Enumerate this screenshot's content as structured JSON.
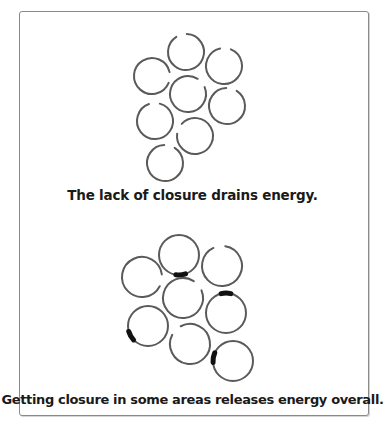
{
  "colors": {
    "ring_stroke": "#5a5a5a",
    "closure_mark": "#111111",
    "frame_border": "#8a8a8a",
    "caption_text": "#1a1a1a"
  },
  "panels": [
    {
      "caption": "The lack of closure drains energy.",
      "ring_radius": 18,
      "rings": [
        {
          "cx": 186,
          "cy": 52,
          "state": "open",
          "gap_center_deg": 255,
          "gap_size_deg": 35
        },
        {
          "cx": 152,
          "cy": 76,
          "state": "open",
          "gap_center_deg": 5,
          "gap_size_deg": 35
        },
        {
          "cx": 224,
          "cy": 66,
          "state": "open",
          "gap_center_deg": 275,
          "gap_size_deg": 35
        },
        {
          "cx": 188,
          "cy": 94,
          "state": "open",
          "gap_center_deg": 320,
          "gap_size_deg": 35
        },
        {
          "cx": 227,
          "cy": 106,
          "state": "open",
          "gap_center_deg": 285,
          "gap_size_deg": 35
        },
        {
          "cx": 155,
          "cy": 121,
          "state": "open",
          "gap_center_deg": 268,
          "gap_size_deg": 35
        },
        {
          "cx": 195,
          "cy": 136,
          "state": "open",
          "gap_center_deg": 205,
          "gap_size_deg": 35
        },
        {
          "cx": 165,
          "cy": 163,
          "state": "open",
          "gap_center_deg": 285,
          "gap_size_deg": 35
        }
      ]
    },
    {
      "caption": "Getting closure in some areas releases energy overall.",
      "ring_radius": 20,
      "rings": [
        {
          "cx": 179,
          "cy": 255,
          "state": "closed",
          "mark_center_deg": 85
        },
        {
          "cx": 142,
          "cy": 277,
          "state": "open",
          "gap_center_deg": 10,
          "gap_size_deg": 35
        },
        {
          "cx": 222,
          "cy": 266,
          "state": "open",
          "gap_center_deg": 262,
          "gap_size_deg": 35
        },
        {
          "cx": 183,
          "cy": 298,
          "state": "open",
          "gap_center_deg": 320,
          "gap_size_deg": 35
        },
        {
          "cx": 226,
          "cy": 313,
          "state": "closed",
          "mark_center_deg": 270
        },
        {
          "cx": 148,
          "cy": 326,
          "state": "closed",
          "mark_center_deg": 150
        },
        {
          "cx": 190,
          "cy": 344,
          "state": "open",
          "gap_center_deg": 225,
          "gap_size_deg": 35
        },
        {
          "cx": 233,
          "cy": 361,
          "state": "closed",
          "mark_center_deg": 190
        }
      ]
    }
  ]
}
